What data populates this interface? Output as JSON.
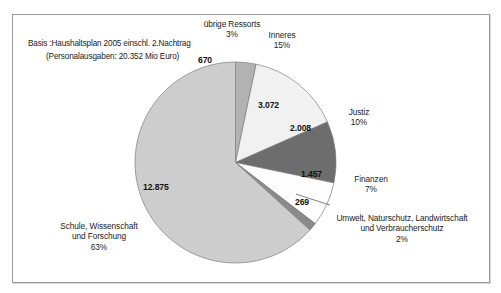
{
  "note": {
    "line1": "Basis :Haushaltsplan 2005 einschl. 2.Nachtrag",
    "line2": "(Personalausgaben:  20.352 Mio Euro)"
  },
  "chart_data": {
    "type": "pie",
    "title": "",
    "unit": "Mio Euro",
    "total_label": "20.352 Mio Euro",
    "total": 20352,
    "legend_position": "callout-labels",
    "grid": false,
    "start_angle_deg": 0,
    "direction": "clockwise",
    "categories": [
      "übrige Ressorts",
      "Inneres",
      "Justiz",
      "Finanzen",
      "Umwelt, Naturschutz, Landwirtschaft und Verbraucherschutz",
      "Schule, Wissenschaft und Forschung"
    ],
    "values": [
      670,
      3072,
      2008,
      1457,
      269,
      12875
    ],
    "percentages": [
      3,
      15,
      10,
      7,
      2,
      63
    ],
    "slices": [
      {
        "name": "übrige Ressorts",
        "label_line1": "übrige Ressorts",
        "label_line2": "3%",
        "value_label": "670",
        "value": 670,
        "percent": 3,
        "color": "#b2b2b2"
      },
      {
        "name": "Inneres",
        "label_line1": "Inneres",
        "label_line2": "15%",
        "value_label": "3.072",
        "value": 3072,
        "percent": 15,
        "color": "#f1f1f1"
      },
      {
        "name": "Justiz",
        "label_line1": "Justiz",
        "label_line2": "10%",
        "value_label": "2.008",
        "value": 2008,
        "percent": 10,
        "color": "#6d6d6d"
      },
      {
        "name": "Finanzen",
        "label_line1": "Finanzen",
        "label_line2": "7%",
        "value_label": "1.457",
        "value": 1457,
        "percent": 7,
        "color": "#fdfdfd"
      },
      {
        "name": "Umwelt, Naturschutz, Landwirtschaft und Verbraucherschutz",
        "label_line1": "Umwelt, Naturschutz, Landwirtschaft",
        "label_line2": "und Verbraucherschutz",
        "label_line3": "2%",
        "value_label": "269",
        "value": 269,
        "percent": 2,
        "color": "#8a8a8a"
      },
      {
        "name": "Schule, Wissenschaft und Forschung",
        "label_line1": "Schule, Wissenschaft",
        "label_line2": "und Forschung",
        "label_line3": "63%",
        "value_label": "12.875",
        "value": 12875,
        "percent": 63,
        "color": "#cdcdcd"
      }
    ]
  }
}
